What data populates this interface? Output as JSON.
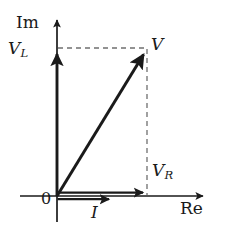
{
  "figure": {
    "type": "phasor-diagram",
    "background_color": "#ffffff",
    "stroke_color": "#1a1a1a",
    "dashed_color": "#6f6f6f"
  },
  "axes": {
    "imaginary": {
      "label": "Im",
      "orientation": "vertical",
      "arrow": "up",
      "x": 57,
      "y_top": 18,
      "y_bottom": 222
    },
    "real": {
      "label": "Re",
      "orientation": "horizontal",
      "arrow": "right",
      "y": 196,
      "x_left": 20,
      "x_right": 205
    },
    "origin": {
      "label": "0",
      "x": 57,
      "y": 196
    }
  },
  "vectors": [
    {
      "name": "V_L",
      "label": "V",
      "subscript": "L",
      "from": [
        57,
        196
      ],
      "to": [
        57,
        50
      ],
      "direction": "up",
      "style": "solid-thick",
      "meaning": "inductor voltage phasor along the imaginary axis"
    },
    {
      "name": "V_R",
      "label": "V",
      "subscript": "R",
      "from": [
        57,
        193
      ],
      "to": [
        147,
        193
      ],
      "direction": "right",
      "style": "solid-thick",
      "meaning": "resistor voltage phasor along the real axis"
    },
    {
      "name": "I",
      "label": "I",
      "subscript": "",
      "from": [
        57,
        199
      ],
      "to": [
        113,
        199
      ],
      "direction": "right",
      "style": "solid-thick",
      "meaning": "current phasor along the real axis"
    },
    {
      "name": "V",
      "label": "V",
      "subscript": "",
      "from": [
        57,
        196
      ],
      "to": [
        146,
        50
      ],
      "direction": "up-right",
      "style": "solid-thick",
      "meaning": "total voltage phasor, vector sum of V_R and V_L"
    }
  ],
  "projection_lines": [
    {
      "name": "vl-projection",
      "style": "dashed",
      "from": [
        58,
        48
      ],
      "to": [
        148,
        48
      ],
      "orientation": "horizontal",
      "meaning": "projection of V onto the imaginary axis at V_L"
    },
    {
      "name": "vr-projection",
      "style": "dashed",
      "from": [
        147,
        48
      ],
      "to": [
        147,
        195
      ],
      "orientation": "vertical",
      "meaning": "projection of V onto the real axis at V_R"
    }
  ],
  "labels": {
    "im": "Im",
    "re": "Re",
    "origin": "0",
    "v": "V",
    "v_l_base": "V",
    "v_l_sub": "L",
    "v_r_base": "V",
    "v_r_sub": "R",
    "i": "I"
  }
}
